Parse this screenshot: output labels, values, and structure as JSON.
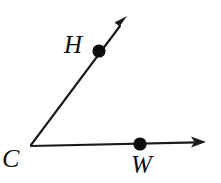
{
  "figure": {
    "type": "geometry-angle-diagram",
    "background_color": "#ffffff",
    "stroke_color": "#1a1a1a",
    "width": 221,
    "height": 183,
    "vertex": {
      "id": "C",
      "label": "C",
      "x": 31,
      "y": 145
    },
    "rays": [
      {
        "id": "ray-CH",
        "name": "ray-c-h",
        "from": {
          "x": 31,
          "y": 145
        },
        "to": {
          "x": 127,
          "y": 17
        },
        "arrowhead": true,
        "through_point": "H"
      },
      {
        "id": "ray-CW",
        "name": "ray-c-w",
        "from": {
          "x": 31,
          "y": 146
        },
        "to": {
          "x": 205,
          "y": 142
        },
        "arrowhead": true,
        "through_point": "W"
      }
    ],
    "points": [
      {
        "id": "H",
        "label": "H",
        "x": 99,
        "y": 51,
        "radius": 6.5,
        "label_x": 76,
        "label_y": 45,
        "on_ray": "ray-CH"
      },
      {
        "id": "W",
        "label": "W",
        "x": 140,
        "y": 144,
        "radius": 6.5,
        "label_x": 144,
        "label_y": 166,
        "on_ray": "ray-CW"
      }
    ],
    "labels": {
      "vertex_label": "C",
      "upper_point_label": "H",
      "lower_point_label": "W"
    }
  }
}
